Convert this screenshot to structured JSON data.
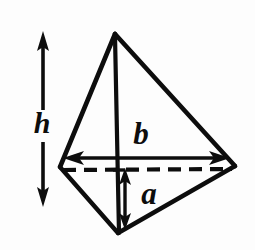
{
  "figure": {
    "name": "tetrahedron-dimension-diagram",
    "type": "geometric-line-drawing",
    "background_color": "#fdfdfd",
    "stroke_color": "#0d0d0d",
    "canvas": {
      "width": 255,
      "height": 250
    }
  },
  "labels": {
    "height": "h",
    "base": "b",
    "apothem": "a"
  },
  "label_positions": {
    "height": {
      "x": 42,
      "y": 126,
      "font_size": 30
    },
    "base": {
      "x": 141,
      "y": 137,
      "font_size": 30
    },
    "apothem": {
      "x": 149,
      "y": 197,
      "font_size": 30
    }
  },
  "vertices": {
    "apex": {
      "x": 115,
      "y": 34
    },
    "left": {
      "x": 60,
      "y": 167
    },
    "right": {
      "x": 235,
      "y": 166
    },
    "bottom": {
      "x": 118,
      "y": 233
    },
    "center": {
      "x": 122,
      "y": 167
    }
  },
  "solid_edges": [
    {
      "name": "apex-to-left",
      "x1": 115,
      "y1": 34,
      "x2": 60,
      "y2": 167
    },
    {
      "name": "apex-to-right",
      "x1": 115,
      "y1": 34,
      "x2": 235,
      "y2": 166
    },
    {
      "name": "apex-to-bottom",
      "x1": 115,
      "y1": 34,
      "x2": 118,
      "y2": 233
    },
    {
      "name": "left-to-bottom",
      "x1": 60,
      "y1": 167,
      "x2": 118,
      "y2": 233
    },
    {
      "name": "right-to-bottom",
      "x1": 235,
      "y1": 166,
      "x2": 118,
      "y2": 233
    }
  ],
  "hidden_edge": {
    "name": "left-to-right-hidden-base",
    "x1": 62,
    "y1": 170,
    "x2": 233,
    "y2": 169,
    "dash_pattern": "13 8"
  },
  "dimension_arrows": [
    {
      "name": "height-arrow",
      "orientation": "vertical",
      "label": "h",
      "x": 43,
      "y_start": 32,
      "y_end": 205,
      "gap_start": 110,
      "gap_end": 142,
      "double_headed": true
    },
    {
      "name": "base-arrow",
      "orientation": "horizontal",
      "label": "b",
      "y": 158,
      "x_start": 65,
      "x_end": 228,
      "double_headed": true
    },
    {
      "name": "apothem-arrow",
      "orientation": "vertical",
      "label": "a",
      "x": 125,
      "y_start": 170,
      "y_end": 228,
      "double_headed": true
    }
  ],
  "stroke_widths": {
    "edge": 4.2,
    "vertical_edge": 4.0,
    "hidden_edge": 4.0,
    "arrow_shaft": 3.4
  }
}
